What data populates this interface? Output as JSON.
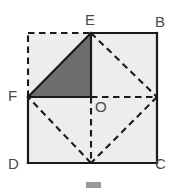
{
  "figure": {
    "labels": {
      "E": "E",
      "B": "B",
      "F": "F",
      "O": "O",
      "D": "D",
      "C": "C"
    },
    "colors": {
      "square_fill": "#ededed",
      "shaded_triangle_fill": "#6e6e6e",
      "stroke": "#1a1a1a",
      "dashed_stroke": "#1a1a1a",
      "label_color": "#4a4a4a",
      "background": "#ffffff",
      "footer_mark": "#9a9a9a"
    },
    "points": {
      "E": {
        "x": 91,
        "y": 33
      },
      "B": {
        "x": 157,
        "y": 33
      },
      "C": {
        "x": 157,
        "y": 163
      },
      "D": {
        "x": 28,
        "y": 163
      },
      "A": {
        "x": 28,
        "y": 33
      },
      "F": {
        "x": 28,
        "y": 97
      },
      "O": {
        "x": 91,
        "y": 97
      },
      "R": {
        "x": 157,
        "y": 97
      },
      "M": {
        "x": 91,
        "y": 163
      }
    },
    "label_positions": {
      "E": {
        "x": 85,
        "y": 12
      },
      "B": {
        "x": 155,
        "y": 14
      },
      "F": {
        "x": 8,
        "y": 88
      },
      "O": {
        "x": 95,
        "y": 99
      },
      "D": {
        "x": 8,
        "y": 156
      },
      "C": {
        "x": 155,
        "y": 156
      }
    },
    "segments": {
      "solid": [
        {
          "name": "edge-E-B",
          "from": "E",
          "to": "B"
        },
        {
          "name": "edge-B-C",
          "from": "B",
          "to": "C"
        },
        {
          "name": "edge-C-D",
          "from": "C",
          "to": "D"
        },
        {
          "name": "edge-D-F",
          "from": "D",
          "to": "F"
        },
        {
          "name": "edge-F-O",
          "from": "F",
          "to": "O"
        },
        {
          "name": "edge-E-O",
          "from": "E",
          "to": "O"
        },
        {
          "name": "hypotenuse-F-E",
          "from": "F",
          "to": "E"
        }
      ],
      "dashed": [
        {
          "name": "dashed-F-A",
          "from": "F",
          "to": "A"
        },
        {
          "name": "dashed-A-E",
          "from": "A",
          "to": "E"
        },
        {
          "name": "dashed-E-R",
          "from": "E",
          "to": "R"
        },
        {
          "name": "dashed-R-M",
          "from": "R",
          "to": "M"
        },
        {
          "name": "dashed-M-F",
          "from": "M",
          "to": "F"
        },
        {
          "name": "dashed-O-R",
          "from": "O",
          "to": "R"
        },
        {
          "name": "dashed-O-M",
          "from": "O",
          "to": "M"
        }
      ]
    },
    "shapes": {
      "square_polygon": "28,33 157,33 157,163 28,163",
      "shaded_triangle": "28,97 91,33 91,97"
    },
    "footer_mark": {
      "x": 86,
      "y": 182,
      "width": 15,
      "height": 6
    }
  }
}
